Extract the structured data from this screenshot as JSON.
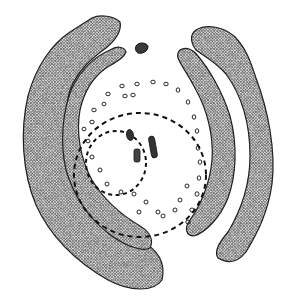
{
  "figure": {
    "title": "",
    "kind": "archaeological site plan (stippled)",
    "colors": {
      "ink": "#1a1a1a",
      "stipple_mid": "#7a7a7a",
      "background": "#ffffff"
    }
  },
  "features": {
    "outer_bank_left": "outer-bank-left",
    "inner_bank_left": "inner-bank-left",
    "outer_bank_right": "outer-bank-right",
    "inner_bank_right": "inner-bank-right",
    "top_stone": "isolated-stone",
    "outer_dashed_circle": "outer-dashed-circle",
    "inner_dashed_circle": "inner-dashed-circle",
    "central_stones": [
      "stone-1",
      "stone-2",
      "stone-3"
    ],
    "post_holes_count": 34
  }
}
